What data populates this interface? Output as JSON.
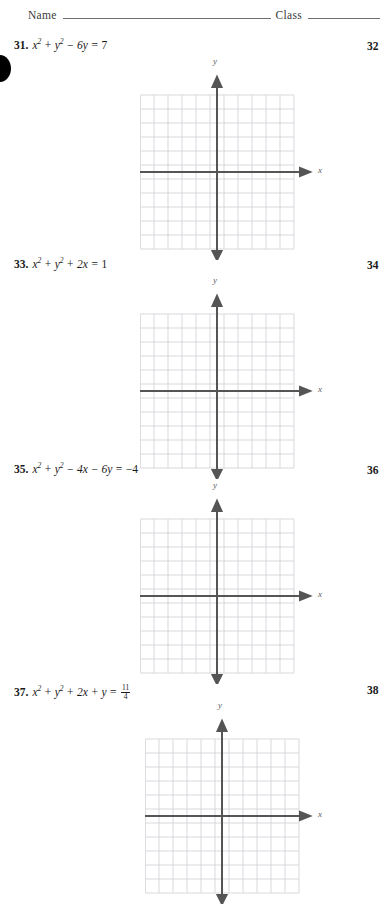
{
  "header": {
    "name_label": "Name",
    "class_label": "Class"
  },
  "axis_labels": {
    "x": "x",
    "y": "y"
  },
  "problems": [
    {
      "number": "31.",
      "equation_text": "x² + y² − 6y = 7",
      "right_number": "32",
      "terms": {
        "t1": "x",
        "t1sup": "2",
        "op1": "+",
        "t2": "y",
        "t2sup": "2",
        "op2": "−",
        "t3": "6y",
        "op3": "=",
        "rhs": "7"
      }
    },
    {
      "number": "33.",
      "equation_text": "x² + y² + 2x = 1",
      "right_number": "34",
      "terms": {
        "t1": "x",
        "t1sup": "2",
        "op1": "+",
        "t2": "y",
        "t2sup": "2",
        "op2": "+",
        "t3": "2x",
        "op3": "=",
        "rhs": "1"
      }
    },
    {
      "number": "35.",
      "equation_text": "x² + y² − 4x − 6y = −4",
      "right_number": "36",
      "terms": {
        "t1": "x",
        "t1sup": "2",
        "op1": "+",
        "t2": "y",
        "t2sup": "2",
        "op2": "−",
        "t3": "4x",
        "op2b": "−",
        "t4": "6y",
        "op3": "=",
        "rhs": "−4"
      }
    },
    {
      "number": "37.",
      "equation_text": "x² + y² + 2x + y = 11/4",
      "right_number": "38",
      "terms": {
        "t1": "x",
        "t1sup": "2",
        "op1": "+",
        "t2": "y",
        "t2sup": "2",
        "op2": "+",
        "t3": "2x",
        "op2b": "+",
        "t4": "y",
        "op3": "=",
        "frac_numer": "11",
        "frac_denom": "4"
      }
    }
  ],
  "grid": {
    "columns": 11,
    "rows": 11,
    "cell_size": 14,
    "grid_color": "#cfcfd6",
    "axis_color": "#555555"
  }
}
